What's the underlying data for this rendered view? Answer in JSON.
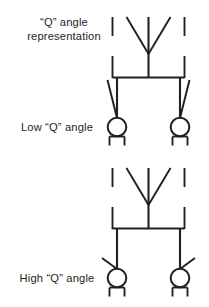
{
  "figure": {
    "title": "“Q” angle representation",
    "background_color": "#ffffff",
    "line_color": "#231f20",
    "width": 209,
    "height": 307
  },
  "labels": {
    "caption_top_line1": "“Q” angle",
    "caption_top_line2": "representation",
    "caption_low": "Low “Q” angle",
    "caption_high": "High “Q” angle"
  },
  "diagrams": [
    {
      "id": "low-q",
      "caption": "Low “Q” angle",
      "link_style": "steep",
      "description": "Suspension with steeply angled control link"
    },
    {
      "id": "high-q",
      "caption": "High “Q” angle",
      "link_style": "shallow",
      "description": "Suspension with shallow, near-horizontal control link"
    }
  ]
}
